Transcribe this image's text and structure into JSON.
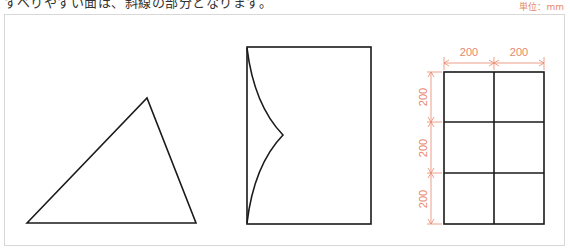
{
  "header": {
    "instruction_text": "すべりやすい面は、斜線の部分となります。",
    "unit_label": "単位：mm"
  },
  "figures": [
    {
      "name": "triangle",
      "type": "polygon",
      "points": [
        [
          27,
          223
        ],
        [
          147,
          98
        ],
        [
          196,
          223
        ]
      ]
    },
    {
      "name": "rectangle-with-cusp",
      "type": "rect-with-curves",
      "rect": [
        247,
        47,
        371,
        224
      ],
      "cusp": [
        283,
        135
      ]
    },
    {
      "name": "grid-2x3",
      "type": "grid",
      "cols": 2,
      "rows": 3,
      "cell_mm": 200
    }
  ],
  "dimensions": {
    "horizontal": [
      "200",
      "200"
    ],
    "vertical": [
      "200",
      "200",
      "200"
    ]
  },
  "colors": {
    "line": "#1a1a1a",
    "dimension": "#e8876a",
    "border": "#d8d8d8"
  }
}
